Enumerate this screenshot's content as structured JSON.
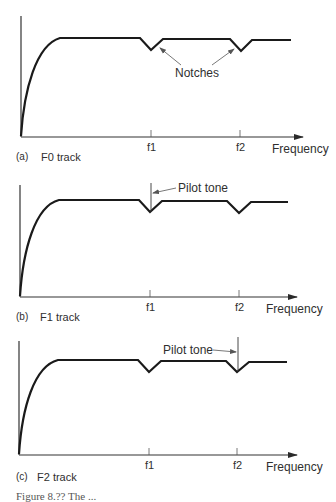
{
  "figure": {
    "caption_partial": "Figure 8.?? The ...",
    "x_axis_label": "Frequency",
    "tick_labels": [
      "f1",
      "f2"
    ],
    "panels": [
      {
        "id": "a",
        "tag": "(a)",
        "title": "F0 track",
        "annotation": "Notches",
        "pilot_tone_at": null
      },
      {
        "id": "b",
        "tag": "(b)",
        "title": "F1 track",
        "annotation": "Pilot tone",
        "pilot_tone_at": "f1"
      },
      {
        "id": "c",
        "tag": "(c)",
        "title": "F2 track",
        "annotation": "Pilot tone",
        "pilot_tone_at": "f2"
      }
    ]
  },
  "colors": {
    "line": "#1a1a1a",
    "text": "#2f2f2f",
    "background": "#ffffff"
  }
}
